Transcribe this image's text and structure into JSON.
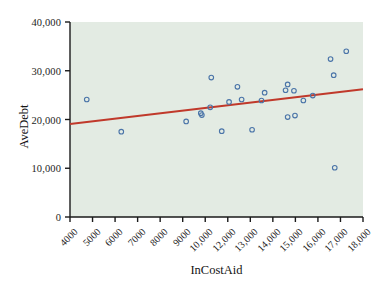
{
  "chart_data": {
    "type": "scatter",
    "title": "",
    "xlabel": "InCostAid",
    "ylabel": "AveDebt",
    "xlim": [
      4000,
      18000
    ],
    "ylim": [
      0,
      40000
    ],
    "grid": false,
    "legend": null,
    "background_color": "#e3ebe3",
    "marker_color": "#4a74a8",
    "marker_style": "open-circle",
    "trendline": {
      "name": "linear fit",
      "color": "#c0392b",
      "x_start": 4000,
      "y_start": 19100,
      "x_end": 18000,
      "y_end": 26200
    },
    "xticks": [
      "4000",
      "5000",
      "6000",
      "7000",
      "8000",
      "9000",
      "10,000",
      "12,000",
      "13,000",
      "14,000",
      "15,000",
      "16,000",
      "17,000",
      "18,000"
    ],
    "yticks": [
      "0",
      "10,000",
      "20,000",
      "30,000",
      "40,000"
    ],
    "points": [
      {
        "x": 4800,
        "y": 24100
      },
      {
        "x": 6450,
        "y": 17500
      },
      {
        "x": 9550,
        "y": 19600
      },
      {
        "x": 10250,
        "y": 21300
      },
      {
        "x": 10300,
        "y": 20900
      },
      {
        "x": 10700,
        "y": 22500
      },
      {
        "x": 10750,
        "y": 28600
      },
      {
        "x": 11250,
        "y": 17600
      },
      {
        "x": 11600,
        "y": 23600
      },
      {
        "x": 12000,
        "y": 26700
      },
      {
        "x": 12200,
        "y": 24100
      },
      {
        "x": 12700,
        "y": 17900
      },
      {
        "x": 13150,
        "y": 23900
      },
      {
        "x": 13300,
        "y": 25500
      },
      {
        "x": 14300,
        "y": 26000
      },
      {
        "x": 14400,
        "y": 27200
      },
      {
        "x": 14400,
        "y": 20500
      },
      {
        "x": 14700,
        "y": 25900
      },
      {
        "x": 14750,
        "y": 20800
      },
      {
        "x": 15150,
        "y": 23900
      },
      {
        "x": 15600,
        "y": 24900
      },
      {
        "x": 16450,
        "y": 32400
      },
      {
        "x": 16600,
        "y": 29100
      },
      {
        "x": 16650,
        "y": 10100
      },
      {
        "x": 17200,
        "y": 34000
      }
    ]
  }
}
